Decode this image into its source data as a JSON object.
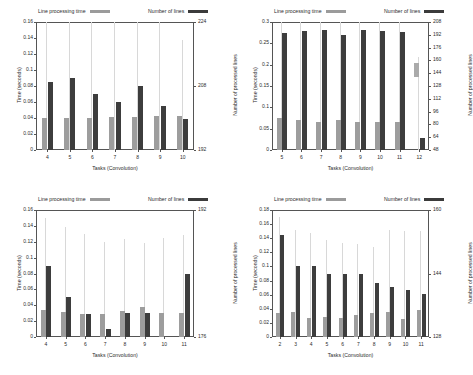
{
  "legend": {
    "series_light": "Line processing time",
    "series_dark": "Number of lines",
    "light_color": "#9d9d9d",
    "dark_color": "#3d3d3d"
  },
  "axis_titles": {
    "y_left": "Time (seconds)",
    "y_right": "Number of processed lines",
    "x": "Tasks (Convolution)"
  },
  "chart_data": [
    {
      "id": "chart-top-left",
      "type": "bar",
      "title": "",
      "xlabel": "Tasks (Convolution)",
      "ylabel": "Time (seconds)",
      "y2label": "Number of processed lines",
      "categories": [
        "4",
        "5",
        "6",
        "7",
        "8",
        "9",
        "10"
      ],
      "ylim": [
        0,
        0.16
      ],
      "yticks": [
        "0",
        "0.02",
        "0.04",
        "0.06",
        "0.08",
        "0.1",
        "0.12",
        "0.14",
        "0.16"
      ],
      "y2lim": [
        192,
        224
      ],
      "y2ticks": [
        "192",
        "208",
        "224"
      ],
      "grid": false,
      "legend_position": "top",
      "series": [
        {
          "name": "Line processing time",
          "values": [
            0.04,
            0.0405,
            0.04,
            0.0408,
            0.041,
            0.042,
            0.0425
          ]
        },
        {
          "name": "Number of lines",
          "values": [
            0.0845,
            0.0895,
            0.0695,
            0.0595,
            0.0795,
            0.0545,
            0.039
          ]
        }
      ],
      "whiskers": [
        0.16,
        0.16,
        0.16,
        0.16,
        0.16,
        0.16,
        0.137
      ]
    },
    {
      "id": "chart-top-right",
      "type": "bar",
      "title": "",
      "xlabel": "Tasks (Convolution)",
      "ylabel": "Time (seconds)",
      "y2label": "Number of processed lines",
      "categories": [
        "5",
        "6",
        "7",
        "8",
        "9",
        "10",
        "11",
        "12"
      ],
      "ylim": [
        0,
        0.3
      ],
      "yticks": [
        "0",
        "0.05",
        "0.1",
        "0.15",
        "0.2",
        "0.25",
        "0.3"
      ],
      "y2lim": [
        48,
        208
      ],
      "y2ticks": [
        "48",
        "64",
        "80",
        "96",
        "112",
        "128",
        "144",
        "160",
        "176",
        "192",
        "208"
      ],
      "grid": false,
      "legend_position": "top",
      "series": [
        {
          "name": "Line processing time",
          "values": [
            0.0745,
            0.071,
            0.0655,
            0.07,
            0.0665,
            0.0665,
            0.0665,
            0.0
          ]
        },
        {
          "name": "Number of lines",
          "values": [
            0.274,
            0.278,
            0.282,
            0.27,
            0.282,
            0.278,
            0.276,
            0.027
          ]
        }
      ],
      "whiskers": [
        0.3,
        0.3,
        0.3,
        0.3,
        0.3,
        0.3,
        0.3,
        0.218
      ],
      "float_marker": {
        "category": "12",
        "y_low": 0.172,
        "y_high": 0.205
      }
    },
    {
      "id": "chart-bottom-left",
      "type": "bar",
      "title": "",
      "xlabel": "Tasks (Convolution)",
      "ylabel": "Time (seconds)",
      "y2label": "Number of processed lines",
      "categories": [
        "4",
        "5",
        "6",
        "7",
        "8",
        "9",
        "10",
        "11"
      ],
      "ylim": [
        0,
        0.16
      ],
      "yticks": [
        "0",
        "0.02",
        "0.04",
        "0.06",
        "0.08",
        "0.1",
        "0.12",
        "0.14",
        "0.16"
      ],
      "y2lim": [
        176,
        192
      ],
      "y2ticks": [
        "176",
        "192"
      ],
      "grid": false,
      "legend_position": "top",
      "series": [
        {
          "name": "Line processing time",
          "values": [
            0.0335,
            0.032,
            0.029,
            0.0295,
            0.033,
            0.038,
            0.03,
            0.03
          ]
        },
        {
          "name": "Number of lines",
          "values": [
            0.09,
            0.05,
            0.029,
            0.01,
            0.03,
            0.03,
            0.0,
            0.0795
          ]
        }
      ],
      "whiskers": [
        0.15,
        0.138,
        0.13,
        0.12,
        0.124,
        0.118,
        0.125,
        0.128
      ]
    },
    {
      "id": "chart-bottom-right",
      "type": "bar",
      "title": "",
      "xlabel": "Tasks (Convolution)",
      "ylabel": "Time (seconds)",
      "y2label": "Number of processed lines",
      "categories": [
        "2",
        "3",
        "4",
        "5",
        "6",
        "7",
        "8",
        "9",
        "10",
        "11"
      ],
      "ylim": [
        0,
        0.18
      ],
      "yticks": [
        "0",
        "0.02",
        "0.04",
        "0.06",
        "0.08",
        "0.1",
        "0.12",
        "0.14",
        "0.16",
        "0.18"
      ],
      "y2lim": [
        128,
        160
      ],
      "y2ticks": [
        "128",
        "144",
        "160"
      ],
      "grid": false,
      "legend_position": "top",
      "series": [
        {
          "name": "Line processing time",
          "values": [
            0.0345,
            0.035,
            0.027,
            0.0285,
            0.027,
            0.031,
            0.034,
            0.0355,
            0.026,
            0.038
          ]
        },
        {
          "name": "Number of lines",
          "values": [
            0.145,
            0.101,
            0.101,
            0.0895,
            0.0895,
            0.0895,
            0.077,
            0.071,
            0.066,
            0.0605
          ]
        }
      ],
      "whiskers": [
        0.17,
        0.152,
        0.148,
        0.137,
        0.133,
        0.132,
        0.128,
        0.152,
        0.15,
        0.15
      ]
    }
  ]
}
